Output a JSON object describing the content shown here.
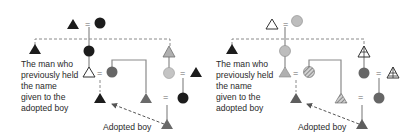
{
  "diagrams": [
    {
      "id": "left",
      "description_label": [
        "The man who",
        "previously held",
        "the name",
        "given to the",
        "adopted boy"
      ],
      "adopted_label": "Adopted boy",
      "colors": {
        "black": "#1c1c1c",
        "dark_gray": "#5e5e5e",
        "mid_gray": "#7a7a7a",
        "light_gray": "#b8b8b8",
        "line": "#808080"
      }
    },
    {
      "id": "right",
      "description_label": [
        "The man who",
        "previously held",
        "the name",
        "given to the",
        "adopted boy"
      ],
      "adopted_label": "Adopted boy",
      "colors": {
        "black": "#1c1c1c",
        "dark_gray": "#5e5e5e",
        "mid_gray": "#7a7a7a",
        "light_gray": "#b8b8b8",
        "line": "#808080"
      }
    }
  ],
  "legend_symbols": {
    "triangle": "male",
    "circle": "female",
    "equals": "marriage",
    "dashed_line": "naming / adoption link"
  }
}
